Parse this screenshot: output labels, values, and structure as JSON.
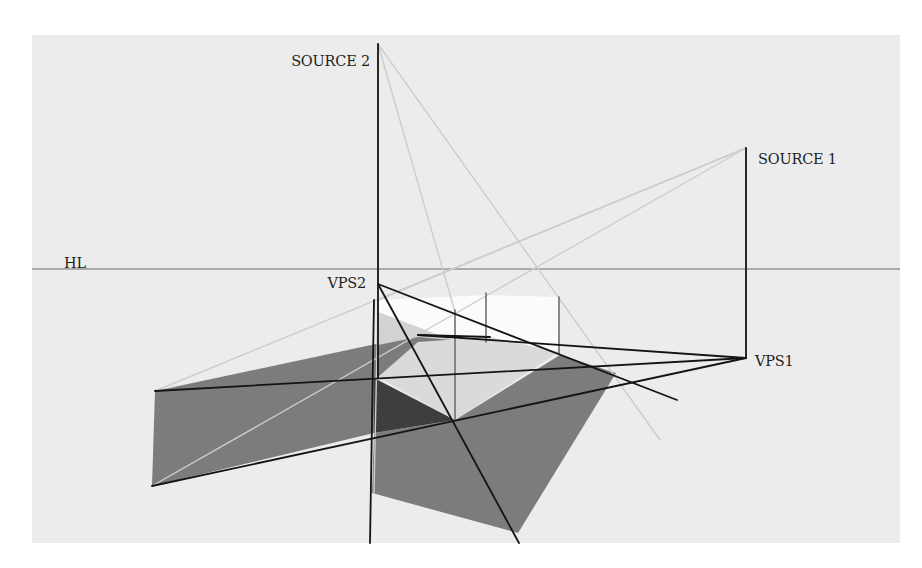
{
  "figure": {
    "canvas": {
      "width": 922,
      "height": 568
    },
    "panel": {
      "x": 32,
      "y": 35,
      "w": 868,
      "h": 508,
      "fill": "#ececec"
    },
    "colors": {
      "page_background": "#ffffff",
      "panel_background": "#ececec",
      "shadow_gray": "#7c7c7c",
      "shadow_dark": "#3e3e3e",
      "lit_face": "#fbfbfb",
      "light_face": "#dadada",
      "construction_line_dark": "#141414",
      "construction_line_light": "#cdcdcd",
      "horizon_line": "#6a6a6a",
      "label_text": "#1e1e1e"
    },
    "labels": {
      "source2": {
        "text": "SOURCE 2",
        "x": 370,
        "y": 66,
        "anchor": "end"
      },
      "source1": {
        "text": "SOURCE 1",
        "x": 758,
        "y": 164,
        "anchor": "start"
      },
      "hl": {
        "text": "HL",
        "x": 64,
        "y": 268,
        "anchor": "start"
      },
      "vps2": {
        "text": "VPS2",
        "x": 366,
        "y": 288,
        "anchor": "end"
      },
      "vps1": {
        "text": "VPS1",
        "x": 755,
        "y": 366,
        "anchor": "start"
      }
    },
    "points": {
      "source2": [
        378,
        44
      ],
      "source1": [
        746,
        148
      ],
      "vps2": [
        378,
        284
      ],
      "vps1": [
        746,
        358
      ],
      "horizon_y": 269
    },
    "shapes": [
      {
        "name": "left-shadow-plane",
        "fill": "#7c7c7c",
        "points": "155,391 418,335 490,337 374,378 374,433 152,486"
      },
      {
        "name": "lower-shadow-plane",
        "fill": "#7c7c7c",
        "points": "374,433 455,420 560,355 616,373 518,533 372,493"
      },
      {
        "name": "dark-shadow-wedge",
        "fill": "#3e3e3e",
        "points": "374,378 455,420 374,433"
      },
      {
        "name": "top-lit-face",
        "fill": "#fbfbfb",
        "points": "378,300 486,295 559,297 559,352 486,341 452,340 378,312"
      },
      {
        "name": "floor-light-face",
        "fill": "#dadada",
        "points": "378,377 418,342 490,337 559,352 455,420"
      },
      {
        "name": "left-light-face",
        "fill": "#d2d2d2",
        "points": "378,312 452,340 418,337 378,345"
      }
    ],
    "dark_lines": [
      {
        "name": "source2-vertical",
        "x1": 378,
        "y1": 44,
        "x2": 378,
        "y2": 378
      },
      {
        "name": "source1-vertical",
        "x1": 746,
        "y1": 148,
        "x2": 746,
        "y2": 358
      },
      {
        "name": "front-left-vertical",
        "x1": 374,
        "y1": 300,
        "x2": 370,
        "y2": 543
      },
      {
        "name": "vps2-to-far-right",
        "x1": 378,
        "y1": 284,
        "x2": 677,
        "y2": 400
      },
      {
        "name": "vps2-to-bottom",
        "x1": 378,
        "y1": 284,
        "x2": 519,
        "y2": 543
      },
      {
        "name": "vps1-to-shadow-top-left",
        "x1": 746,
        "y1": 358,
        "x2": 418,
        "y2": 335
      },
      {
        "name": "vps1-to-left-shadow-top",
        "x1": 746,
        "y1": 358,
        "x2": 155,
        "y2": 391
      },
      {
        "name": "vps1-to-left-shadow-bottom",
        "x1": 746,
        "y1": 358,
        "x2": 152,
        "y2": 486
      },
      {
        "name": "cube-edge-top",
        "x1": 418,
        "y1": 335,
        "x2": 490,
        "y2": 337
      }
    ],
    "mid_lines": [
      {
        "name": "cube-vertical-1",
        "x1": 455,
        "y1": 310,
        "x2": 455,
        "y2": 420
      },
      {
        "name": "cube-vertical-2",
        "x1": 486,
        "y1": 293,
        "x2": 486,
        "y2": 342
      },
      {
        "name": "cube-vertical-3",
        "x1": 559,
        "y1": 297,
        "x2": 559,
        "y2": 354
      }
    ],
    "light_lines": [
      {
        "name": "source2-ray-a",
        "x1": 378,
        "y1": 44,
        "x2": 455,
        "y2": 312
      },
      {
        "name": "source2-ray-b",
        "x1": 378,
        "y1": 44,
        "x2": 660,
        "y2": 440
      },
      {
        "name": "source1-ray-a",
        "x1": 746,
        "y1": 148,
        "x2": 155,
        "y2": 391
      },
      {
        "name": "source1-ray-b",
        "x1": 746,
        "y1": 148,
        "x2": 152,
        "y2": 486
      },
      {
        "name": "source1-ray-c",
        "x1": 746,
        "y1": 148,
        "x2": 378,
        "y2": 300
      },
      {
        "name": "front-edge-highlight",
        "x1": 378,
        "y1": 300,
        "x2": 374,
        "y2": 493
      }
    ]
  }
}
